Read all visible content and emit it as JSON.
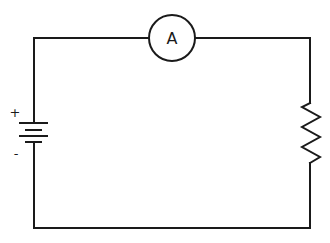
{
  "diagram": {
    "type": "circuit",
    "components": {
      "battery": {
        "positive_label": "+",
        "negative_label": "-"
      },
      "ammeter": {
        "label": "A"
      },
      "resistor": {
        "label": ""
      }
    },
    "colors": {
      "stroke": "#1a1a1a",
      "background": "#ffffff"
    }
  }
}
